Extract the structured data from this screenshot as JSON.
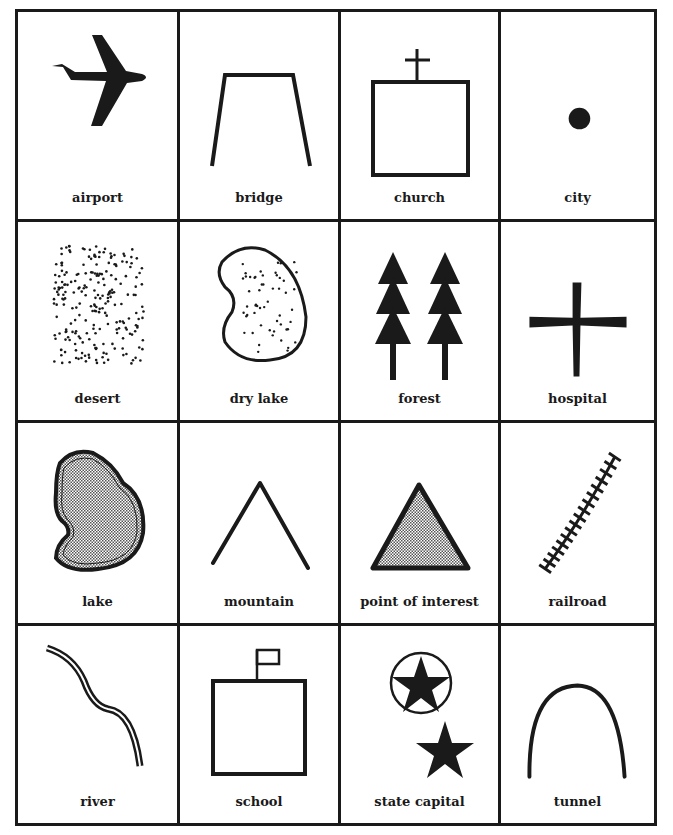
{
  "colors": {
    "ink": "#1a1a1a",
    "background": "#ffffff",
    "hatch": "#999999"
  },
  "symbols": [
    {
      "label": "airport",
      "icon": "airplane-icon"
    },
    {
      "label": "bridge",
      "icon": "bridge-icon"
    },
    {
      "label": "church",
      "icon": "church-icon"
    },
    {
      "label": "city",
      "icon": "dot-icon"
    },
    {
      "label": "desert",
      "icon": "dotted-rectangle-icon"
    },
    {
      "label": "dry lake",
      "icon": "dotted-blob-icon"
    },
    {
      "label": "forest",
      "icon": "trees-icon"
    },
    {
      "label": "hospital",
      "icon": "cross-icon"
    },
    {
      "label": "lake",
      "icon": "shaded-blob-icon"
    },
    {
      "label": "mountain",
      "icon": "peak-icon"
    },
    {
      "label": "point of interest",
      "icon": "shaded-triangle-icon"
    },
    {
      "label": "railroad",
      "icon": "track-icon"
    },
    {
      "label": "river",
      "icon": "double-wavy-line-icon"
    },
    {
      "label": "school",
      "icon": "flag-building-icon"
    },
    {
      "label": "state capital",
      "icon": "star-icon"
    },
    {
      "label": "tunnel",
      "icon": "arch-icon"
    }
  ]
}
